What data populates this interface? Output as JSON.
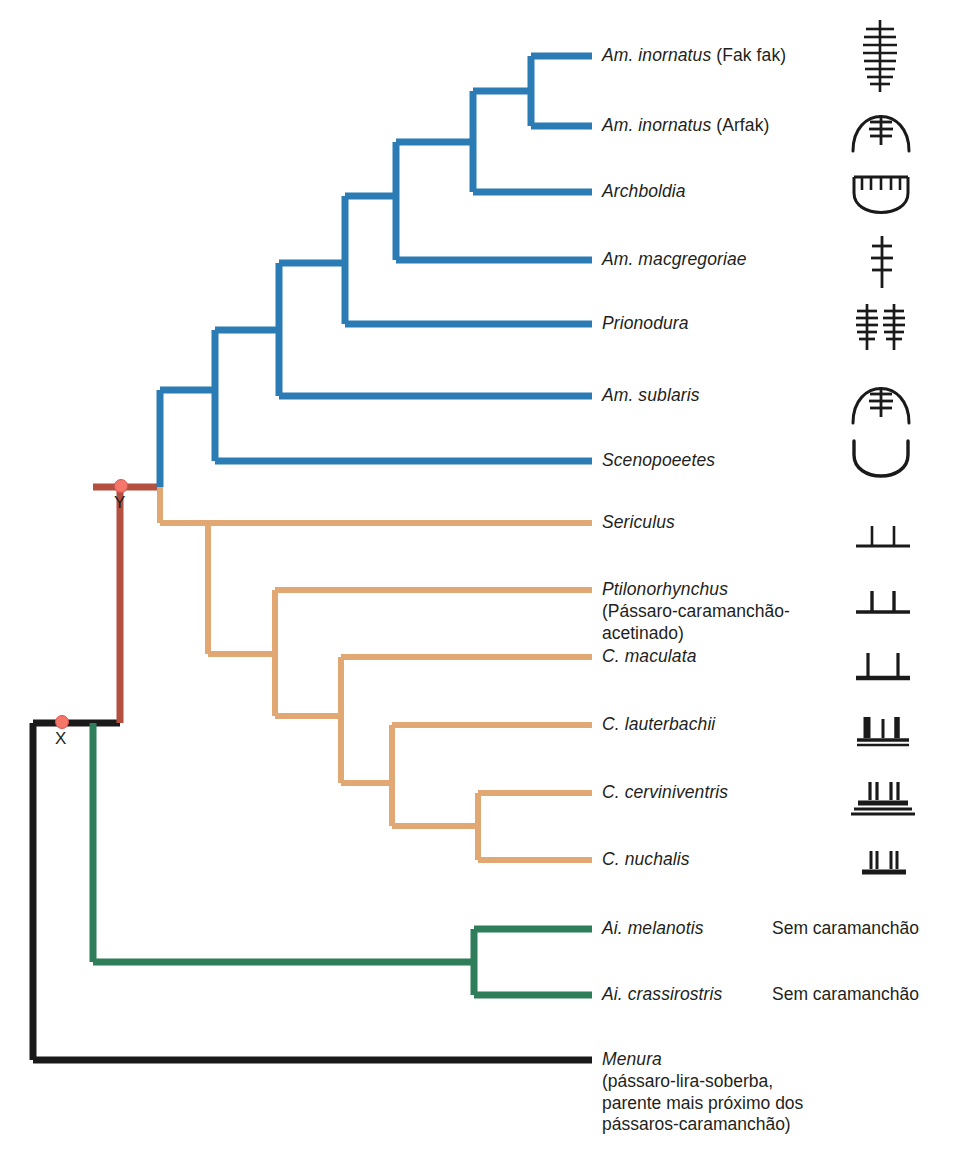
{
  "figure": {
    "type": "phylogenetic-cladogram",
    "width": 969,
    "height": 1174,
    "background": "#ffffff"
  },
  "colors": {
    "blue_clade": "#2b7cb5",
    "tan_clade": "#e2a873",
    "green_clade": "#2e7d5b",
    "red_stem": "#b3503f",
    "black_root": "#1a1a1a",
    "node_dot": "#f4776a",
    "node_dot_stroke": "#d9534f",
    "text": "#231f20",
    "icon": "#1a1a1a"
  },
  "nodes": [
    {
      "id": "X",
      "label": "X",
      "x": 88,
      "y": 723,
      "letter_x": 55,
      "letter_y": 731
    },
    {
      "id": "Y",
      "label": "Y",
      "x": 120,
      "y": 487,
      "letter_x": 114,
      "letter_y": 495
    }
  ],
  "tips": [
    {
      "id": "am-inornatus-fakfak",
      "name": "Am. inornatus (Fak fak)",
      "sci": "Am. inornatus",
      "suffix": " (Fak fak)",
      "sub": "",
      "clade": "blue",
      "y": 56,
      "label_x": 602,
      "bower_note": "",
      "icon": "maypole-dense-stick"
    },
    {
      "id": "am-inornatus-arfak",
      "name": "Am. inornatus (Arfak)",
      "sci": "Am. inornatus",
      "suffix": " (Arfak)",
      "sub": "",
      "clade": "blue",
      "y": 126,
      "label_x": 602,
      "bower_note": "",
      "icon": "maypole-with-hut-arc"
    },
    {
      "id": "archboldia",
      "name": "Archboldia",
      "sci": "Archboldia",
      "suffix": "",
      "sub": "",
      "clade": "blue",
      "y": 192,
      "label_x": 602,
      "bower_note": "",
      "icon": "mat-court-comb"
    },
    {
      "id": "am-macgregoriae",
      "name": "Am. macgregoriae",
      "sci": "Am. macgregoriae",
      "suffix": "",
      "sub": "",
      "clade": "blue",
      "y": 260,
      "label_x": 602,
      "bower_note": "",
      "icon": "maypole-short-stick"
    },
    {
      "id": "prionodura",
      "name": "Prionodura",
      "sci": "Prionodura",
      "suffix": "",
      "sub": "",
      "clade": "blue",
      "y": 324,
      "label_x": 602,
      "bower_note": "",
      "icon": "maypole-twin-towers"
    },
    {
      "id": "am-sublaris",
      "name": "Am. sublaris",
      "sci": "Am. sublaris",
      "suffix": "",
      "sub": "",
      "clade": "blue",
      "y": 396,
      "label_x": 602,
      "bower_note": "",
      "icon": "maypole-with-hut-arc"
    },
    {
      "id": "scenopoeetes",
      "name": "Scenopoeetes",
      "sci": "Scenopoeetes",
      "suffix": "",
      "sub": "",
      "clade": "blue",
      "y": 461,
      "label_x": 602,
      "bower_note": "",
      "icon": "court-arc-only"
    },
    {
      "id": "sericulus",
      "name": "Sericulus",
      "sci": "Sericulus",
      "suffix": "",
      "sub": "",
      "clade": "tan",
      "y": 523,
      "label_x": 602,
      "bower_note": "",
      "icon": "avenue-thin-walls"
    },
    {
      "id": "ptilonorhynchus",
      "name": "Ptilonorhynchus",
      "sci": "Ptilonorhynchus",
      "suffix": "",
      "sub": "(Pássaro-caramanchão-\nacetinado)",
      "clade": "tan",
      "y": 590,
      "label_x": 602,
      "bower_note": "",
      "icon": "avenue-medium-walls"
    },
    {
      "id": "c-maculata",
      "name": "C. maculata",
      "sci": "C. maculata",
      "suffix": "",
      "sub": "",
      "clade": "tan",
      "y": 657,
      "label_x": 602,
      "bower_note": "",
      "icon": "avenue-tall-walls-platform"
    },
    {
      "id": "c-lauterbachii",
      "name": "C. lauterbachii",
      "sci": "C. lauterbachii",
      "suffix": "",
      "sub": "",
      "clade": "tan",
      "y": 725,
      "label_x": 602,
      "bower_note": "",
      "icon": "avenue-triple-wall-platform"
    },
    {
      "id": "c-cerviniventris",
      "name": "C. cerviniventris",
      "sci": "C. cerviniventris",
      "suffix": "",
      "sub": "",
      "clade": "tan",
      "y": 793,
      "label_x": 602,
      "bower_note": "",
      "icon": "avenue-stacked-platform"
    },
    {
      "id": "c-nuchalis",
      "name": "C. nuchalis",
      "sci": "C. nuchalis",
      "suffix": "",
      "sub": "",
      "clade": "tan",
      "y": 860,
      "label_x": 602,
      "bower_note": "",
      "icon": "avenue-twin-thick-walls"
    },
    {
      "id": "ai-melanotis",
      "name": "Ai. melanotis",
      "sci": "Ai. melanotis",
      "suffix": "",
      "sub": "",
      "clade": "green",
      "y": 929,
      "label_x": 602,
      "bower_note": "Sem caramanchão",
      "icon": "none"
    },
    {
      "id": "ai-crassirostris",
      "name": "Ai. crassirostris",
      "sci": "Ai. crassirostris",
      "suffix": "",
      "sub": "",
      "clade": "green",
      "y": 995,
      "label_x": 602,
      "bower_note": "Sem caramanchão",
      "icon": "none"
    },
    {
      "id": "menura",
      "name": "Menura",
      "sci": "Menura",
      "suffix": "",
      "sub": "(pássaro-lira-soberba,\nparente mais próximo dos\npássaros-caramanchão)",
      "clade": "black",
      "y": 1060,
      "label_x": 602,
      "bower_note": "",
      "icon": "none"
    }
  ],
  "bower_note_x": 772,
  "icon_x": 848,
  "labels": {
    "sem_caramanchao": "Sem caramanchão"
  }
}
